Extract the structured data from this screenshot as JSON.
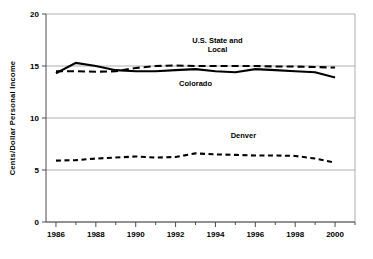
{
  "chart_data": {
    "type": "line",
    "title": "",
    "xlabel": "",
    "ylabel": "Cents/Dollar Personal Income",
    "xlim": [
      1985.5,
      2001.0
    ],
    "ylim": [
      0,
      20
    ],
    "yticks": [
      0,
      5,
      10,
      15,
      20
    ],
    "ytick_labels": [
      "0",
      "5",
      "10",
      "15",
      "20"
    ],
    "xticks": [
      1986,
      1988,
      1990,
      1992,
      1994,
      1996,
      1998,
      2000
    ],
    "xtick_labels": [
      "1986",
      "1988",
      "1990",
      "1992",
      "1994",
      "1996",
      "1998",
      "2000"
    ],
    "grid": true,
    "legend_position": "inline-annotations",
    "x": [
      1986,
      1987,
      1988,
      1989,
      1990,
      1991,
      1992,
      1993,
      1994,
      1995,
      1996,
      1997,
      1998,
      1999,
      2000
    ],
    "series": [
      {
        "name": "U.S. State and Local",
        "style": "dashed",
        "values": [
          14.5,
          14.5,
          14.45,
          14.5,
          14.8,
          15.0,
          15.05,
          15.0,
          15.0,
          15.0,
          15.0,
          14.95,
          14.95,
          14.9,
          14.85
        ]
      },
      {
        "name": "Colorado",
        "style": "solid",
        "values": [
          14.3,
          15.3,
          15.0,
          14.6,
          14.5,
          14.5,
          14.6,
          14.7,
          14.5,
          14.4,
          14.7,
          14.6,
          14.5,
          14.4,
          13.9
        ]
      },
      {
        "name": "Denver",
        "style": "dashed-short",
        "values": [
          5.9,
          5.95,
          6.1,
          6.2,
          6.3,
          6.2,
          6.25,
          6.6,
          6.5,
          6.45,
          6.4,
          6.4,
          6.35,
          6.1,
          5.7
        ]
      }
    ],
    "annotations": [
      {
        "name": "us-state-and-local",
        "text_line1": "U.S. State and",
        "text_line2": "Local",
        "x": 1994.1,
        "y": 17.2
      },
      {
        "name": "colorado",
        "text_line1": "Colorado",
        "text_line2": "",
        "x": 1993.0,
        "y": 13.05
      },
      {
        "name": "denver",
        "text_line1": "Denver",
        "text_line2": "",
        "x": 1995.4,
        "y": 8.1
      }
    ]
  }
}
